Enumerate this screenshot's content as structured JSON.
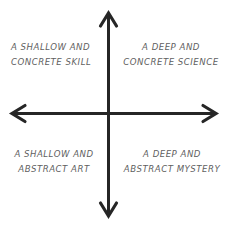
{
  "diagram": {
    "background_color": "#ffffff",
    "axis": {
      "name": "crosshair-axes",
      "color": "#262626",
      "stroke_width": 3,
      "origin_x": 108,
      "origin_y": 113,
      "vertical_top": 12,
      "vertical_bottom": 217,
      "horizontal_left": 11,
      "horizontal_right": 217,
      "arrowheads": [
        "up",
        "down",
        "left",
        "right"
      ],
      "arrow_half_width": 7,
      "arrow_length": 14
    },
    "labels": {
      "top_left": {
        "line1": "A SHALLOW AND",
        "line2": "CONCRETE SKILL"
      },
      "top_right": {
        "line1": "A DEEP AND",
        "line2": "CONCRETE SCIENCE"
      },
      "bottom_left": {
        "line1": "A SHALLOW AND",
        "line2": "ABSTRACT ART"
      },
      "bottom_right": {
        "line1": "A DEEP AND",
        "line2": "ABSTRACT MYSTERY"
      }
    },
    "label_color": "#5f5f5f"
  }
}
